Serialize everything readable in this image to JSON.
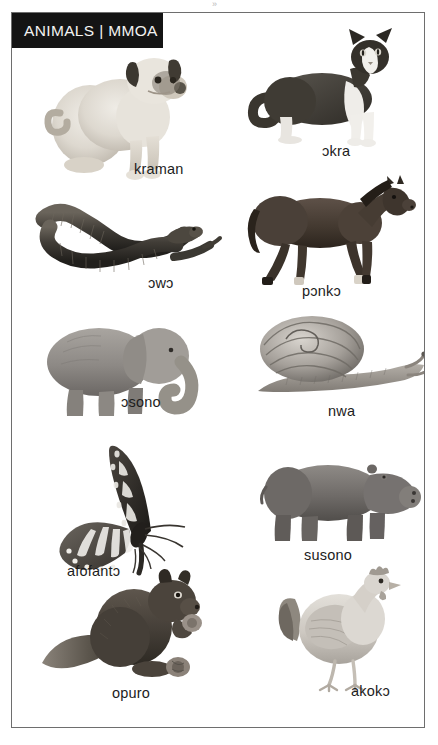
{
  "page": {
    "header_title": "ANIMALS | MMOA",
    "scan_mark": "»",
    "frame_color": "#6e6e6e",
    "banner_color": "#141414",
    "banner_text_color": "#f2f2f2",
    "label_text_color": "#1c1c1c",
    "background_color": "#ffffff"
  },
  "entries": [
    {
      "id": "dog",
      "label": "kraman",
      "english": "dog",
      "icon": "dog-photo",
      "column": "left",
      "row": 1
    },
    {
      "id": "cat",
      "label": "ɔkra",
      "english": "cat",
      "icon": "cat-photo",
      "column": "right",
      "row": 1
    },
    {
      "id": "snake",
      "label": "ɔwɔ",
      "english": "snake",
      "icon": "snake-photo",
      "column": "left",
      "row": 2
    },
    {
      "id": "horse",
      "label": "pɔnkɔ",
      "english": "horse",
      "icon": "horse-photo",
      "column": "right",
      "row": 2
    },
    {
      "id": "elephant",
      "label": "ɔsono",
      "english": "elephant",
      "icon": "elephant-photo",
      "column": "left",
      "row": 3
    },
    {
      "id": "snail",
      "label": "nwa",
      "english": "snail",
      "icon": "snail-photo",
      "column": "right",
      "row": 3
    },
    {
      "id": "butterfly",
      "label": "afofantɔ",
      "english": "butterfly",
      "icon": "butterfly-photo",
      "column": "left",
      "row": 4
    },
    {
      "id": "hippopotamus",
      "label": "susono",
      "english": "hippopotamus",
      "icon": "hippopotamus-photo",
      "column": "right",
      "row": 4
    },
    {
      "id": "squirrel",
      "label": "opuro",
      "english": "squirrel",
      "icon": "squirrel-photo",
      "column": "left",
      "row": 5
    },
    {
      "id": "chicken",
      "label": "akokɔ",
      "english": "chicken",
      "icon": "chicken-photo",
      "column": "right",
      "row": 5
    }
  ]
}
